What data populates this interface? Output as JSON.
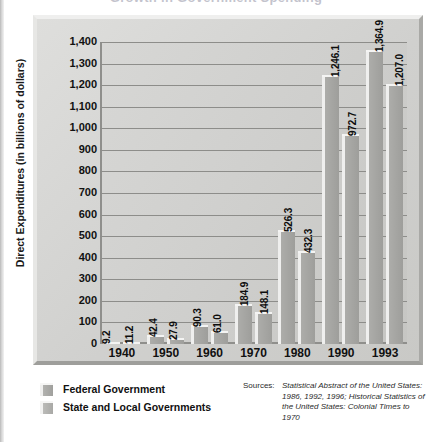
{
  "title": "Growth in Government Spending",
  "y_axis_title": "Direct Expenditures (in billions of dollars)",
  "legend": {
    "federal": "Federal Government",
    "state_local": "State and Local Governments"
  },
  "sources": {
    "label": "Sources:",
    "text": "Statistical Abstract of the United States: 1986, 1992, 1996; Historical Statistics of the United States: Colonial Times to 1970"
  },
  "chart_data": {
    "type": "bar",
    "title": "Growth in Government Spending",
    "xlabel": "",
    "ylabel": "Direct Expenditures (in billions of dollars)",
    "ylim": [
      0,
      1400
    ],
    "ytick_step": 100,
    "grid": true,
    "legend_position": "bottom-left",
    "ytick_labels": [
      "1,400",
      "1,300",
      "1,200",
      "1,100",
      "1,000",
      "900",
      "800",
      "700",
      "600",
      "500",
      "400",
      "300",
      "200",
      "100",
      "0"
    ],
    "categories": [
      "1940",
      "1950",
      "1960",
      "1970",
      "1980",
      "1990",
      "1993"
    ],
    "series": [
      {
        "name": "Federal Government",
        "values": [
          9.2,
          42.4,
          90.3,
          184.9,
          526.3,
          1246.1,
          1364.9
        ],
        "labels": [
          "9.2",
          "42.4",
          "90.3",
          "184.9",
          "526.3",
          "1,246.1",
          "1,364.9"
        ],
        "color": "#a0a09d"
      },
      {
        "name": "State and Local Governments",
        "values": [
          11.2,
          27.9,
          61.0,
          148.1,
          432.3,
          972.7,
          1207.0
        ],
        "labels": [
          "11.2",
          "27.9",
          "61.0",
          "148.1",
          "432.3",
          "972.7",
          "1,207.0"
        ],
        "color": "#a9a9a6"
      }
    ]
  }
}
